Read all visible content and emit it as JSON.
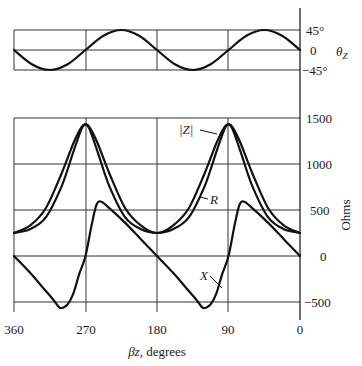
{
  "chart_data": [
    {
      "type": "line",
      "title": "",
      "xlabel": "βz, degrees",
      "ylabel": "θ_Z",
      "x_ticks": [
        "360",
        "270",
        "180",
        "90",
        "0"
      ],
      "x_range": [
        360,
        0
      ],
      "y_ticks": [
        "45°",
        "0",
        "−45°"
      ],
      "ylim": [
        -45,
        45
      ],
      "grid": true,
      "series": [
        {
          "name": "θ_Z",
          "x": [
            360,
            337.5,
            315,
            292.5,
            270,
            247.5,
            225,
            202.5,
            180,
            157.5,
            135,
            112.5,
            90,
            67.5,
            45,
            22.5,
            0
          ],
          "values": [
            0,
            -32,
            -45,
            -32,
            0,
            32,
            45,
            32,
            0,
            -32,
            -45,
            -32,
            0,
            32,
            45,
            32,
            0
          ]
        }
      ]
    },
    {
      "type": "line",
      "title": "",
      "xlabel": "βz, degrees",
      "ylabel": "Ohms",
      "x_ticks": [
        "360",
        "270",
        "180",
        "90",
        "0"
      ],
      "x_range": [
        360,
        0
      ],
      "y_ticks": [
        "1500",
        "1000",
        "500",
        "0",
        "−500"
      ],
      "ylim": [
        -600,
        1500
      ],
      "grid": true,
      "series": [
        {
          "name": "|Z|",
          "x": [
            360,
            340,
            320,
            300,
            285,
            275,
            270,
            265,
            255,
            240,
            220,
            200,
            180,
            160,
            140,
            120,
            105,
            95,
            90,
            85,
            75,
            60,
            40,
            20,
            0
          ],
          "values": [
            250,
            330,
            520,
            900,
            1230,
            1400,
            1430,
            1400,
            1230,
            900,
            520,
            330,
            250,
            330,
            520,
            900,
            1230,
            1400,
            1430,
            1400,
            1230,
            900,
            520,
            330,
            250
          ]
        },
        {
          "name": "R",
          "x": [
            360,
            340,
            320,
            300,
            285,
            275,
            270,
            265,
            255,
            240,
            220,
            200,
            180,
            160,
            140,
            120,
            105,
            95,
            90,
            85,
            75,
            60,
            40,
            20,
            0
          ],
          "values": [
            250,
            290,
            420,
            760,
            1140,
            1380,
            1430,
            1380,
            1140,
            760,
            420,
            290,
            250,
            290,
            420,
            760,
            1140,
            1380,
            1430,
            1380,
            1140,
            760,
            420,
            290,
            250
          ]
        },
        {
          "name": "X",
          "x": [
            360,
            340,
            320,
            310,
            303,
            298,
            292,
            285,
            278,
            270,
            262,
            256,
            250,
            240,
            220,
            200,
            180,
            160,
            140,
            130,
            123,
            118,
            112,
            105,
            98,
            90,
            82,
            76,
            70,
            60,
            40,
            20,
            0
          ],
          "values": [
            0,
            -180,
            -380,
            -480,
            -560,
            -560,
            -520,
            -400,
            -200,
            0,
            350,
            560,
            590,
            520,
            360,
            180,
            0,
            -180,
            -380,
            -480,
            -560,
            -560,
            -520,
            -400,
            -200,
            0,
            350,
            560,
            590,
            520,
            360,
            180,
            0
          ]
        }
      ],
      "annotations": [
        "|Z|",
        "R",
        "X"
      ]
    }
  ],
  "labels": {
    "theta_axis": "θ",
    "theta_sub": "Z",
    "theta_ticks": [
      "45°",
      "0",
      "−45°"
    ],
    "ohms_axis": "Ohms",
    "ohms_ticks": [
      "1500",
      "1000",
      "500",
      "0",
      "−500"
    ],
    "x_ticks": [
      "360",
      "270",
      "180",
      "90",
      "0"
    ],
    "x_label_beta": "βz",
    "x_label_rest": ", degrees",
    "z_label": "|Z|",
    "r_label": "R",
    "x_label": "X"
  }
}
